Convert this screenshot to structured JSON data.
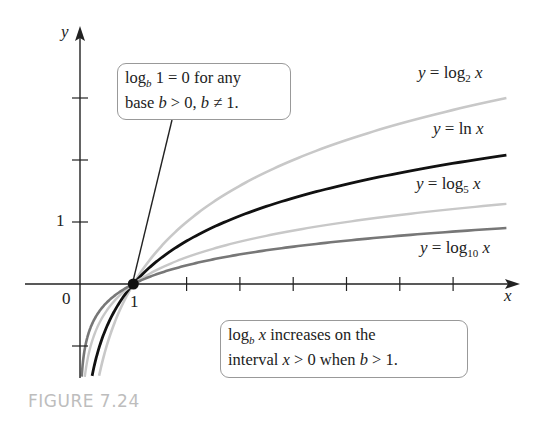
{
  "chart_data": {
    "type": "line",
    "title": "",
    "xlabel": "x",
    "ylabel": "y",
    "x_range": [
      0,
      8
    ],
    "y_range": [
      -1.5,
      3
    ],
    "x_ticks": [
      1,
      2,
      3,
      4,
      5,
      6,
      7,
      8
    ],
    "y_ticks": [
      -1,
      1,
      2,
      3
    ],
    "labeled_ticks": {
      "x": [
        "1"
      ],
      "y": [
        "1"
      ],
      "origin": "0"
    },
    "grid": false,
    "series": [
      {
        "name": "y = log2 x",
        "base": 2,
        "color": "#c8c8c8",
        "width": 2.6
      },
      {
        "name": "y = ln x",
        "base": 2.718281828,
        "color": "#111111",
        "width": 2.8
      },
      {
        "name": "y = log5 x",
        "base": 5,
        "color": "#c8c8c8",
        "width": 2.4
      },
      {
        "name": "y = log10 x",
        "base": 10,
        "color": "#777777",
        "width": 2.6
      }
    ],
    "highlight_point": {
      "x": 1,
      "y": 0
    },
    "annotations": [
      "log_b 1 = 0 for any base b > 0, b ≠ 1.",
      "log_b x increases on the interval x > 0 when b > 1."
    ]
  },
  "axes": {
    "x_label": "x",
    "y_label": "y",
    "origin": "0",
    "x_one": "1",
    "y_one": "1"
  },
  "labels": {
    "log2": {
      "pre": "y = log",
      "sub": "2",
      "post": " x"
    },
    "ln": {
      "pre": "y = ln ",
      "post": "x"
    },
    "log5": {
      "pre": "y = log",
      "sub": "5",
      "post": " x"
    },
    "log10": {
      "pre": "y = log",
      "sub": "10",
      "post": " x"
    }
  },
  "box1": {
    "l1a": "log",
    "l1sub": "b",
    "l1b": " 1 = 0 for any",
    "l2a": "base ",
    "l2b": "b",
    "l2c": " > 0, ",
    "l2d": "b",
    "l2e": " ≠ 1."
  },
  "box2": {
    "l1a": "log",
    "l1sub": "b",
    "l1b": " x",
    "l1c": " increases on the",
    "l2a": "interval ",
    "l2b": "x",
    "l2c": " > 0 when ",
    "l2d": "b",
    "l2e": " > 1."
  },
  "caption": "FIGURE 7.24"
}
